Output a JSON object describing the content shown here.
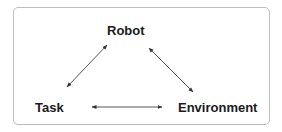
{
  "diagram": {
    "nodes": [
      {
        "id": "robot",
        "label": "Robot"
      },
      {
        "id": "task",
        "label": "Task"
      },
      {
        "id": "environment",
        "label": "Environment"
      }
    ],
    "edges": [
      {
        "from": "robot",
        "to": "task",
        "direction": "bidirectional"
      },
      {
        "from": "robot",
        "to": "environment",
        "direction": "bidirectional"
      },
      {
        "from": "task",
        "to": "environment",
        "direction": "bidirectional"
      }
    ],
    "colors": {
      "text": "#1a1a1a",
      "arrow": "#555555",
      "border": "#bdbdbd"
    }
  }
}
